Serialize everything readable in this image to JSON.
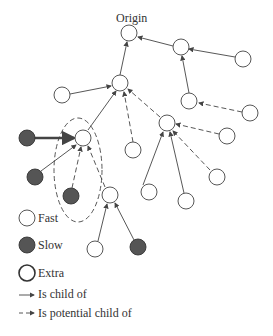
{
  "diagram": {
    "origin_label": "Origin",
    "legend": {
      "fast": "Fast",
      "slow": "Slow",
      "extra": "Extra",
      "child": "Is child of",
      "potential": "Is potential child of"
    },
    "colors": {
      "slow_fill": "#555555",
      "stroke": "#444444",
      "background": "#ffffff"
    }
  }
}
